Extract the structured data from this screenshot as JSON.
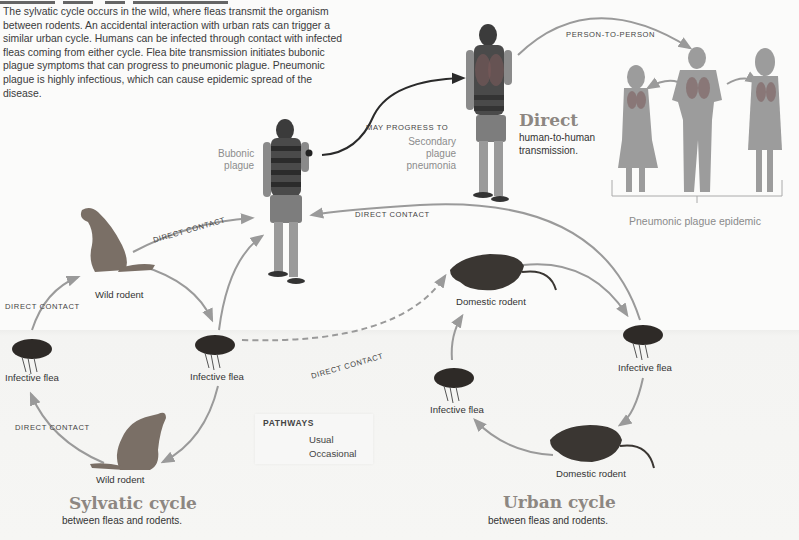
{
  "figure": {
    "title_clipped": true,
    "intro_text": "The sylvatic cycle occurs in the wild, where fleas transmit the organism between rodents. An accidental interaction with urban rats can trigger a similar urban cycle. Humans can be infected through contact with infected fleas coming from either cycle. Flea bite transmission initiates bubonic plague symptoms that can progress to pneumonic plague. Pneumonic plague is highly infectious, which can cause epidemic spread of the disease."
  },
  "human": {
    "bubonic_label_line1": "Bubonic",
    "bubonic_label_line2": "plague",
    "progress_label": "MAY PROGRESS TO",
    "secondary_line1": "Secondary",
    "secondary_line2": "plague",
    "secondary_line3": "pneumonia"
  },
  "direct": {
    "heading": "Direct",
    "sub_line1": "human-to-human",
    "sub_line2": "transmission.",
    "person_to_person_label": "PERSON-TO-PERSON",
    "epidemic_label": "Pneumonic plague epidemic"
  },
  "sylvatic": {
    "heading": "Sylvatic cycle",
    "sub": "between fleas and rodents.",
    "nodes": {
      "wild_rodent_top": "Wild rodent",
      "wild_rodent_bottom": "Wild rodent",
      "flea_left": "Infective flea",
      "flea_right": "Infective flea"
    },
    "edge_labels": {
      "rodent_to_human": "DIRECT CONTACT",
      "flea_to_rodent_top": "DIRECT CONTACT",
      "rodent_to_flea_bottom": "DIRECT CONTACT"
    }
  },
  "urban": {
    "heading": "Urban cycle",
    "sub": "between fleas and rodents.",
    "nodes": {
      "domestic_rodent_top": "Domestic rodent",
      "domestic_rodent_bottom": "Domestic rodent",
      "flea_left": "Infective flea",
      "flea_right": "Infective flea"
    },
    "edge_labels": {
      "flea_to_human": "DIRECT CONTACT",
      "sylvatic_to_urban": "DIRECT CONTACT"
    }
  },
  "legend": {
    "title": "PATHWAYS",
    "items": [
      {
        "label": "Usual",
        "style": "solid"
      },
      {
        "label": "Occasional",
        "style": "dashed"
      }
    ]
  },
  "colors": {
    "arrow": "#9a9a9a",
    "arrow_dark": "#2a2a2a",
    "heading": "#8d8782",
    "silhouette": "#9c9c9c",
    "text": "#333333"
  }
}
